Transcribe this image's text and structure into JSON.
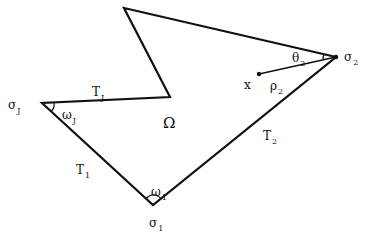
{
  "figure": {
    "type": "polygon-domain-diagram",
    "stroke_color": "#111111",
    "background": "#ffffff",
    "polygon_vertices": [
      {
        "name": "top-vertex",
        "x": 124,
        "y": 8
      },
      {
        "name": "sigma-2",
        "x": 336,
        "y": 57
      },
      {
        "name": "sigma-1",
        "x": 153,
        "y": 205
      },
      {
        "name": "sigma-J",
        "x": 42,
        "y": 103
      },
      {
        "name": "notch-vertex",
        "x": 170,
        "y": 97
      }
    ],
    "interior_point": {
      "name": "x",
      "x": 259,
      "y": 74
    },
    "segment_rho": {
      "from": "x",
      "to": "sigma-2"
    }
  },
  "labels": {
    "region": {
      "main": "Ω",
      "sub": ""
    },
    "sigma_J": {
      "main": "σ",
      "sub": "J"
    },
    "sigma_1": {
      "main": "σ",
      "sub": "1"
    },
    "sigma_2": {
      "main": "σ",
      "sub": "2"
    },
    "T_J": {
      "main": "T",
      "sub": "J"
    },
    "T_1": {
      "main": "T",
      "sub": "1"
    },
    "T_2": {
      "main": "T",
      "sub": "2"
    },
    "omega_J": {
      "main": "ω",
      "sub": "J"
    },
    "omega_1": {
      "main": "ω",
      "sub": "1"
    },
    "theta_2": {
      "main": "θ",
      "sub": "2"
    },
    "rho_2": {
      "main": "ρ",
      "sub": "2"
    },
    "x_point": {
      "main": "x",
      "sub": ""
    }
  }
}
